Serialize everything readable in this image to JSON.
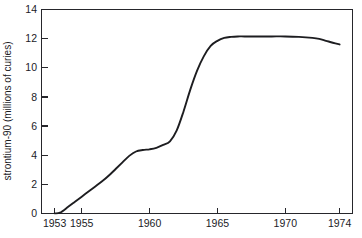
{
  "chart_data": {
    "type": "line",
    "title": "",
    "subtitle": "",
    "xlabel": "",
    "ylabel": "strontium-90 (millions of curies)",
    "xlim": [
      1953,
      1974
    ],
    "ylim": [
      0,
      14
    ],
    "grid": false,
    "legend": "none",
    "x_ticks": [
      1953,
      1955,
      1960,
      1965,
      1970,
      1974
    ],
    "x_tick_labels": [
      "1953",
      "1955",
      "1960",
      "1965",
      "1970",
      "1974"
    ],
    "y_ticks": [
      0,
      2,
      4,
      6,
      8,
      10,
      12,
      14
    ],
    "y_tick_labels": [
      "0",
      "2",
      "4",
      "6",
      "8",
      "10",
      "12",
      "14"
    ],
    "line_color": "#1d1d20",
    "series": [
      {
        "name": "strontium-90",
        "x": [
          1953,
          1953.4,
          1954,
          1954.5,
          1955,
          1955.5,
          1956,
          1956.5,
          1957,
          1957.5,
          1958,
          1958.5,
          1959,
          1959.5,
          1960,
          1960.5,
          1961,
          1961.5,
          1962,
          1962.5,
          1963,
          1963.5,
          1964,
          1964.5,
          1965,
          1965.5,
          1966,
          1966.5,
          1967,
          1968,
          1969,
          1970,
          1971,
          1972,
          1972.5,
          1973,
          1973.5,
          1974
        ],
        "values": [
          0.0,
          0.05,
          0.45,
          0.8,
          1.15,
          1.5,
          1.85,
          2.2,
          2.6,
          3.05,
          3.5,
          3.95,
          4.25,
          4.35,
          4.4,
          4.5,
          4.7,
          4.95,
          5.7,
          7.0,
          8.5,
          9.8,
          10.8,
          11.5,
          11.85,
          12.05,
          12.12,
          12.15,
          12.15,
          12.15,
          12.15,
          12.15,
          12.12,
          12.05,
          11.98,
          11.85,
          11.72,
          11.6
        ]
      }
    ]
  },
  "axes": {
    "y_axis_title": "strontium-90 (millions of curies)"
  }
}
